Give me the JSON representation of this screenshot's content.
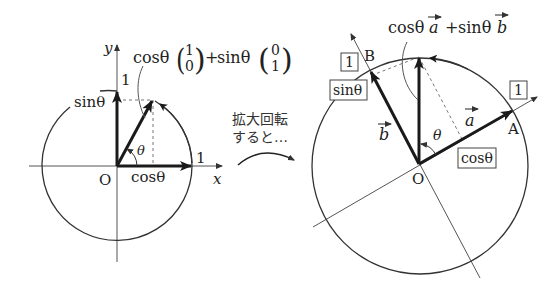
{
  "left_diagram": {
    "axis_x_label": "x",
    "axis_y_label": "y",
    "origin_label": "O",
    "unit_x_label": "1",
    "unit_y_label": "1",
    "cos_label": "cosθ",
    "sin_label": "sinθ",
    "angle_label": "θ",
    "formula": {
      "cos_part": "cosθ",
      "vec1_top": "1",
      "vec1_bottom": "0",
      "plus": "+",
      "sin_part": "sinθ",
      "vec2_top": "0",
      "vec2_bottom": "1"
    }
  },
  "transition": {
    "line1": "拡大回転",
    "line2": "すると…"
  },
  "right_diagram": {
    "origin_label": "O",
    "point_a_label": "A",
    "point_b_label": "B",
    "vec_a_label": "a",
    "vec_b_label": "b",
    "angle_label": "θ",
    "box_one_a": "1",
    "box_one_b": "1",
    "box_cos": "cosθ",
    "box_sin": "sinθ",
    "formula": "cosθa + sinθb",
    "formula_cos": "cosθ",
    "formula_a": "a",
    "formula_plus": "+",
    "formula_sin": "sinθ",
    "formula_b": "b"
  },
  "colors": {
    "ink": "#1a1a1a",
    "axis": "#555555",
    "dashed": "#777777"
  }
}
